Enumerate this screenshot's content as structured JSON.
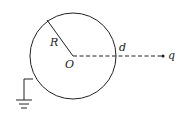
{
  "diagram": {
    "type": "grounded conducting sphere with external point charge",
    "labels": {
      "radius": "R",
      "center": "O",
      "distance": "d",
      "charge": "q"
    },
    "colors": {
      "stroke": "#222222",
      "background": "#ffffff"
    }
  }
}
